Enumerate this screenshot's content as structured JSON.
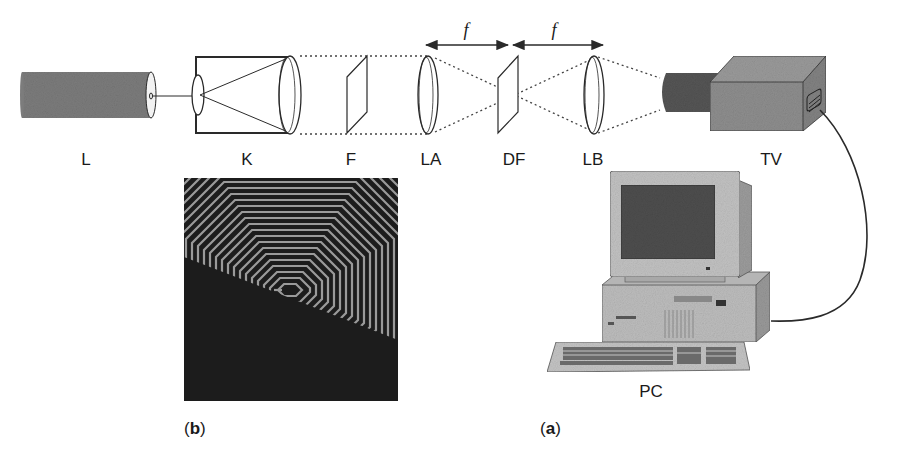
{
  "figure": {
    "components": [
      {
        "id": "L",
        "label": "L",
        "kind": "laser"
      },
      {
        "id": "K",
        "label": "K",
        "kind": "beam-expander-collimator"
      },
      {
        "id": "F",
        "label": "F",
        "kind": "filter"
      },
      {
        "id": "LA",
        "label": "LA",
        "kind": "lens"
      },
      {
        "id": "DF",
        "label": "DF",
        "kind": "diffractive-filter"
      },
      {
        "id": "LB",
        "label": "LB",
        "kind": "lens"
      },
      {
        "id": "TV",
        "label": "TV",
        "kind": "camera"
      },
      {
        "id": "PC",
        "label": "PC",
        "kind": "computer"
      }
    ],
    "distances": {
      "LA_to_DF": "f",
      "DF_to_LB": "f"
    },
    "panels": {
      "a": {
        "label_open": "(",
        "letter": "a",
        "label_close": ")"
      },
      "b": {
        "label_open": "(",
        "letter": "b",
        "label_close": ")"
      }
    },
    "colors": {
      "ink": "#2a2a2a",
      "gray_fill": "#8a8a8a",
      "dark_fill": "#4a4a4a",
      "pattern_dark": "#1c1c1c",
      "pattern_light": "#9a9a9a"
    }
  }
}
